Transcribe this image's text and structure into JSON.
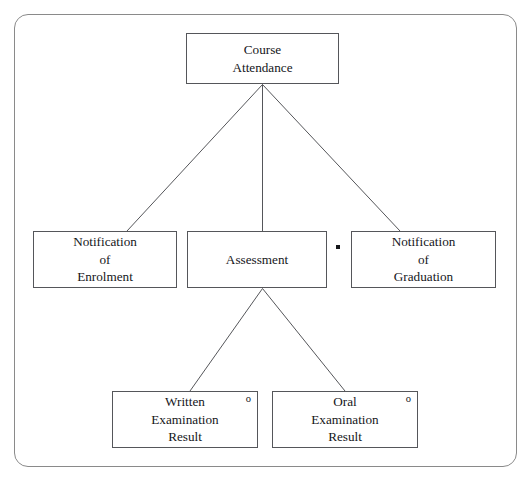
{
  "diagram": {
    "frame": {
      "shape": "rounded-rectangle",
      "stroke_color": "#8a8a8a"
    },
    "box_stroke_color": "#55565a",
    "text_color": "#15161a",
    "nodes": [
      {
        "id": "course-attendance",
        "label": "Course\nAttendance",
        "level": "root",
        "marker": ""
      },
      {
        "id": "notification-of-enrolment",
        "label": "Notification\nof\nEnrolment",
        "level": "child",
        "marker": ""
      },
      {
        "id": "assessment",
        "label": "Assessment",
        "level": "child",
        "marker": ""
      },
      {
        "id": "notification-of-graduation",
        "label": "Notification\nof\nGraduation",
        "level": "child",
        "marker": ""
      },
      {
        "id": "written-examination-result",
        "label": "Written\nExamination\nResult",
        "level": "grandchild",
        "marker": "o"
      },
      {
        "id": "oral-examination-result",
        "label": "Oral\nExamination\nResult",
        "level": "grandchild",
        "marker": "o"
      }
    ],
    "markers": {
      "repetition_dot": "•",
      "optional_marker": "o"
    },
    "edges": [
      {
        "from": "course-attendance",
        "to": "notification-of-enrolment"
      },
      {
        "from": "course-attendance",
        "to": "assessment"
      },
      {
        "from": "course-attendance",
        "to": "notification-of-graduation"
      },
      {
        "from": "assessment",
        "to": "written-examination-result"
      },
      {
        "from": "assessment",
        "to": "oral-examination-result"
      }
    ]
  }
}
